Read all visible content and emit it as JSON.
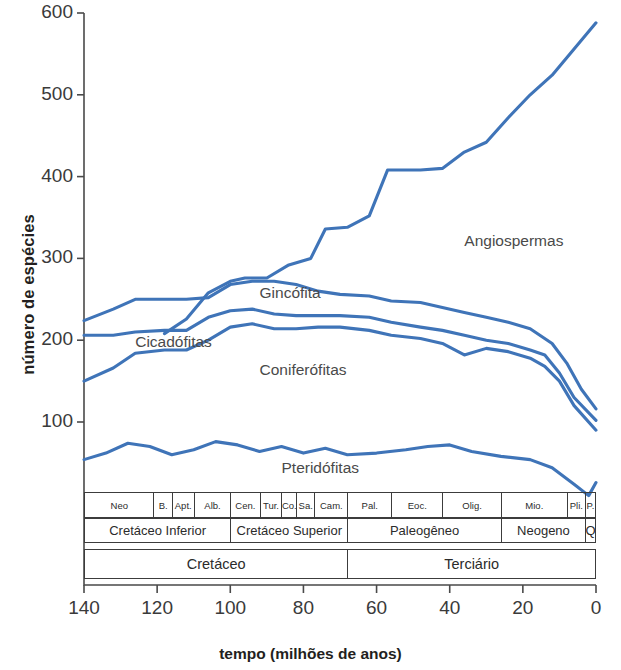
{
  "chart_data": {
    "type": "line",
    "title": "",
    "xlabel": "tempo (milhões de anos)",
    "ylabel": "número de espécies",
    "xlim": [
      140,
      0
    ],
    "ylim": [
      0,
      600
    ],
    "xticks": [
      140,
      120,
      100,
      80,
      60,
      40,
      20,
      0
    ],
    "yticks": [
      100,
      200,
      300,
      400,
      500,
      600
    ],
    "x_reversed": true,
    "grid": false,
    "legend_position": "inline-labels",
    "line_color": "#3f74b8",
    "series": [
      {
        "name": "Angiospermas",
        "label_x": 36,
        "label_y": 320,
        "x": [
          118,
          112,
          106,
          100,
          96,
          90,
          84,
          78,
          74,
          68,
          62,
          57,
          48,
          42,
          36,
          30,
          24,
          18,
          12,
          6,
          0
        ],
        "y": [
          208,
          226,
          258,
          272,
          276,
          276,
          292,
          300,
          336,
          338,
          352,
          408,
          408,
          410,
          430,
          442,
          472,
          500,
          524,
          556,
          588
        ]
      },
      {
        "name": "Gincófita",
        "label_x": 92,
        "label_y": 256,
        "x": [
          140,
          132,
          126,
          118,
          112,
          106,
          100,
          94,
          88,
          82,
          76,
          70,
          62,
          56,
          48,
          42,
          36,
          30,
          24,
          18,
          12,
          8,
          4,
          0
        ],
        "y": [
          224,
          238,
          250,
          250,
          250,
          252,
          268,
          272,
          272,
          268,
          260,
          256,
          254,
          248,
          246,
          240,
          234,
          228,
          222,
          214,
          196,
          172,
          140,
          116
        ]
      },
      {
        "name": "Cicadófitas",
        "label_x": 126,
        "label_y": 196,
        "x": [
          140,
          132,
          126,
          118,
          112,
          106,
          100,
          94,
          88,
          82,
          76,
          70,
          62,
          56,
          48,
          42,
          36,
          30,
          24,
          18,
          14,
          10,
          6,
          0
        ],
        "y": [
          206,
          206,
          210,
          212,
          212,
          228,
          236,
          238,
          232,
          230,
          230,
          230,
          228,
          222,
          216,
          212,
          206,
          200,
          196,
          188,
          182,
          160,
          130,
          102
        ]
      },
      {
        "name": "Coniferófitas",
        "label_x": 92,
        "label_y": 162,
        "x": [
          140,
          132,
          126,
          118,
          112,
          106,
          100,
          94,
          88,
          82,
          76,
          70,
          62,
          56,
          48,
          42,
          36,
          30,
          24,
          18,
          14,
          10,
          6,
          0
        ],
        "y": [
          150,
          166,
          184,
          188,
          188,
          200,
          216,
          220,
          214,
          214,
          216,
          216,
          212,
          206,
          202,
          196,
          182,
          190,
          186,
          178,
          168,
          150,
          120,
          90
        ]
      },
      {
        "name": "Pteridófitas",
        "label_x": 86,
        "label_y": 42,
        "x": [
          140,
          134,
          128,
          122,
          116,
          110,
          104,
          98,
          92,
          86,
          80,
          74,
          68,
          60,
          52,
          46,
          40,
          34,
          26,
          18,
          12,
          6,
          2,
          0
        ],
        "y": [
          54,
          62,
          74,
          70,
          60,
          66,
          76,
          72,
          64,
          70,
          62,
          68,
          60,
          62,
          66,
          70,
          72,
          64,
          58,
          54,
          44,
          24,
          10,
          26
        ]
      }
    ],
    "strat_rows": [
      {
        "row": "epochs",
        "cells": [
          {
            "label": "Neo",
            "start": 140,
            "end": 121
          },
          {
            "label": "B.",
            "start": 121,
            "end": 116
          },
          {
            "label": "Apt.",
            "start": 116,
            "end": 110
          },
          {
            "label": "Alb.",
            "start": 110,
            "end": 100
          },
          {
            "label": "Cen.",
            "start": 100,
            "end": 92
          },
          {
            "label": "Tur.",
            "start": 92,
            "end": 86
          },
          {
            "label": "Co.",
            "start": 86,
            "end": 82
          },
          {
            "label": "Sa.",
            "start": 82,
            "end": 77
          },
          {
            "label": "Cam.",
            "start": 77,
            "end": 68
          },
          {
            "label": "Pal.",
            "start": 68,
            "end": 56
          },
          {
            "label": "Eoc.",
            "start": 56,
            "end": 42
          },
          {
            "label": "Olig.",
            "start": 42,
            "end": 26
          },
          {
            "label": "Mio.",
            "start": 26,
            "end": 8
          },
          {
            "label": "Pli.",
            "start": 8,
            "end": 3
          },
          {
            "label": "P.",
            "start": 3,
            "end": 0
          }
        ]
      },
      {
        "row": "series",
        "cells": [
          {
            "label": "Cretáceo Inferior",
            "start": 140,
            "end": 100
          },
          {
            "label": "Cretáceo Superior",
            "start": 100,
            "end": 68
          },
          {
            "label": "Paleogêneo",
            "start": 68,
            "end": 26
          },
          {
            "label": "Neogeno",
            "start": 26,
            "end": 3
          },
          {
            "label": "Q",
            "start": 3,
            "end": 0
          }
        ]
      },
      {
        "row": "periods",
        "cells": [
          {
            "label": "Cretáceo",
            "start": 140,
            "end": 68
          },
          {
            "label": "Terciário",
            "start": 68,
            "end": 0
          }
        ]
      }
    ]
  },
  "axis": {
    "ylabel": "número de espécies",
    "xtitle": "tempo (milhões de anos)"
  }
}
